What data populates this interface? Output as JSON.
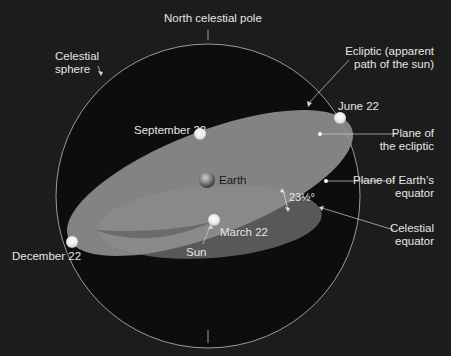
{
  "diagram": {
    "colors": {
      "background": "#1c1c1c",
      "sphere_inner": "#0d0d0d",
      "ecliptic_plane": "#8f8f8f",
      "equator_plane": "#5e5e5e",
      "label_text": "#e6e6e6"
    },
    "labels": {
      "north_pole": "North celestial pole",
      "celestial_sphere_1": "Celestial",
      "celestial_sphere_2": "sphere",
      "ecliptic_1": "Ecliptic (apparent",
      "ecliptic_2": "path of the sun)",
      "june": "June 22",
      "september": "September 22",
      "plane_ecliptic_1": "Plane of",
      "plane_ecliptic_2": "the ecliptic",
      "earth": "Earth",
      "plane_equator_1": "Plane of Earth’s",
      "plane_equator_2": "equator",
      "tilt": "23½°",
      "march": "March 22",
      "sun": "Sun",
      "december": "December 22",
      "celestial_equator_1": "Celestial",
      "celestial_equator_2": "equator"
    }
  }
}
